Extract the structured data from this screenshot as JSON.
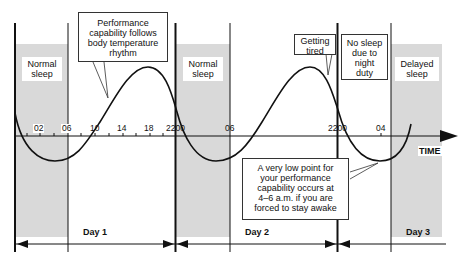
{
  "axis": {
    "label": "TIME",
    "ticks": [
      {
        "label": "02",
        "x": 40
      },
      {
        "label": "06",
        "x": 68
      },
      {
        "label": "10",
        "x": 95
      },
      {
        "label": "14",
        "x": 123
      },
      {
        "label": "18",
        "x": 150
      },
      {
        "label": "2200",
        "x": 177
      },
      {
        "label": "06",
        "x": 230
      },
      {
        "label": "2200",
        "x": 338
      },
      {
        "label": "04",
        "x": 381
      }
    ]
  },
  "sleep_zones": [
    {
      "label_line1": "Normal",
      "label_line2": "sleep"
    },
    {
      "label_line1": "Normal",
      "label_line2": "sleep"
    },
    {
      "label_line1": "Delayed",
      "label_line2": "sleep"
    }
  ],
  "callouts": {
    "performance": [
      "Performance",
      "capability follows",
      "body temperature",
      "rhythm"
    ],
    "tired": [
      "Getting",
      "tired"
    ],
    "no_sleep": [
      "No sleep",
      "due to",
      "night",
      "duty"
    ],
    "low_point": [
      "A very low point for",
      "your performance",
      "capability occurs at",
      "4–6 a.m. if you are",
      "forced to stay awake"
    ]
  },
  "days": [
    {
      "label": "Day 1"
    },
    {
      "label": "Day 2"
    },
    {
      "label": "Day 3"
    }
  ],
  "colors": {
    "shade": "#d9d9d9",
    "line": "#111111"
  }
}
